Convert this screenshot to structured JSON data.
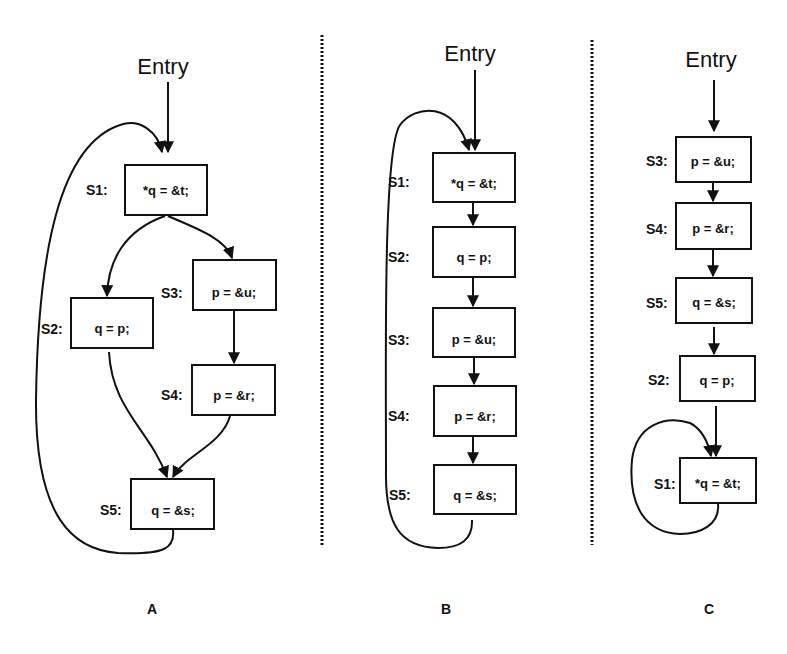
{
  "panels": [
    {
      "caption": "A",
      "entry": "Entry",
      "nodes": [
        {
          "id": "S1",
          "label": "S1:",
          "code": "*q = &t;"
        },
        {
          "id": "S2",
          "label": "S2:",
          "code": "q = p;"
        },
        {
          "id": "S3",
          "label": "S3:",
          "code": "p = &u;"
        },
        {
          "id": "S4",
          "label": "S4:",
          "code": "p = &r;"
        },
        {
          "id": "S5",
          "label": "S5:",
          "code": "q = &s;"
        }
      ],
      "edges": [
        [
          "Entry",
          "S1"
        ],
        [
          "S1",
          "S2"
        ],
        [
          "S1",
          "S3"
        ],
        [
          "S3",
          "S4"
        ],
        [
          "S2",
          "S5"
        ],
        [
          "S4",
          "S5"
        ],
        [
          "S5",
          "S1"
        ]
      ]
    },
    {
      "caption": "B",
      "entry": "Entry",
      "nodes": [
        {
          "id": "S1",
          "label": "S1:",
          "code": "*q = &t;"
        },
        {
          "id": "S2",
          "label": "S2:",
          "code": "q = p;"
        },
        {
          "id": "S3",
          "label": "S3:",
          "code": "p = &u;"
        },
        {
          "id": "S4",
          "label": "S4:",
          "code": "p = &r;"
        },
        {
          "id": "S5",
          "label": "S5:",
          "code": "q = &s;"
        }
      ],
      "edges": [
        [
          "Entry",
          "S1"
        ],
        [
          "S1",
          "S2"
        ],
        [
          "S2",
          "S3"
        ],
        [
          "S3",
          "S4"
        ],
        [
          "S4",
          "S5"
        ],
        [
          "S5",
          "S1"
        ]
      ]
    },
    {
      "caption": "C",
      "entry": "Entry",
      "nodes": [
        {
          "id": "S3",
          "label": "S3:",
          "code": "p = &u;"
        },
        {
          "id": "S4",
          "label": "S4:",
          "code": "p = &r;"
        },
        {
          "id": "S5",
          "label": "S5:",
          "code": "q = &s;"
        },
        {
          "id": "S2",
          "label": "S2:",
          "code": "q = p;"
        },
        {
          "id": "S1",
          "label": "S1:",
          "code": "*q = &t;"
        }
      ],
      "edges": [
        [
          "Entry",
          "S3"
        ],
        [
          "S3",
          "S4"
        ],
        [
          "S4",
          "S5"
        ],
        [
          "S5",
          "S2"
        ],
        [
          "S2",
          "S1"
        ],
        [
          "S1",
          "S1"
        ]
      ]
    }
  ]
}
